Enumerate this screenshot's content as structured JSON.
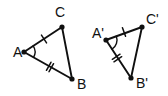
{
  "figure": {
    "kind": "geometry-diagram",
    "background_color": "#ffffff",
    "stroke_color": "#101010",
    "width": 168,
    "height": 96
  },
  "triangles": [
    {
      "id": "triangle-abc",
      "name": "Triangle ABC",
      "vertices": [
        {
          "key": "A",
          "label": "A",
          "x": 24,
          "y": 52,
          "label_x": 13,
          "label_y": 57
        },
        {
          "key": "B",
          "label": "B",
          "x": 72,
          "y": 79,
          "label_x": 77,
          "label_y": 89
        },
        {
          "key": "C",
          "label": "C",
          "x": 62,
          "y": 27,
          "label_x": 55,
          "label_y": 17
        }
      ],
      "sides": [
        {
          "id": "side-ac",
          "from": "A",
          "to": "C",
          "ticks": 1,
          "tick_x": 44,
          "tick_y": 39
        },
        {
          "id": "side-ab",
          "from": "A",
          "to": "B",
          "ticks": 2,
          "tick_x": 50,
          "tick_y": 67
        },
        {
          "id": "side-cb",
          "from": "C",
          "to": "B",
          "ticks": 0
        }
      ],
      "angle_mark": {
        "id": "angle-a",
        "vertex": "A",
        "radius": 11,
        "arcs": 1
      }
    },
    {
      "id": "triangle-a-prime-b-prime-c-prime",
      "name": "Triangle A'B'C'",
      "vertices": [
        {
          "key": "A'",
          "label": "A'",
          "x": 106,
          "y": 40,
          "label_x": 92,
          "label_y": 38
        },
        {
          "key": "B'",
          "label": "B'",
          "x": 131,
          "y": 78,
          "label_x": 136,
          "label_y": 88
        },
        {
          "key": "C'",
          "label": "C'",
          "x": 142,
          "y": 27,
          "label_x": 146,
          "label_y": 24
        }
      ],
      "sides": [
        {
          "id": "side-ac-prime",
          "from": "A'",
          "to": "C'",
          "ticks": 1,
          "tick_x": 124,
          "tick_y": 32
        },
        {
          "id": "side-ab-prime",
          "from": "A'",
          "to": "B'",
          "ticks": 2,
          "tick_x": 117,
          "tick_y": 58
        },
        {
          "id": "side-cb-prime",
          "from": "C'",
          "to": "B'",
          "ticks": 0
        }
      ],
      "angle_mark": {
        "id": "angle-a-prime",
        "vertex": "A'",
        "radius": 11,
        "arcs": 1
      }
    }
  ]
}
